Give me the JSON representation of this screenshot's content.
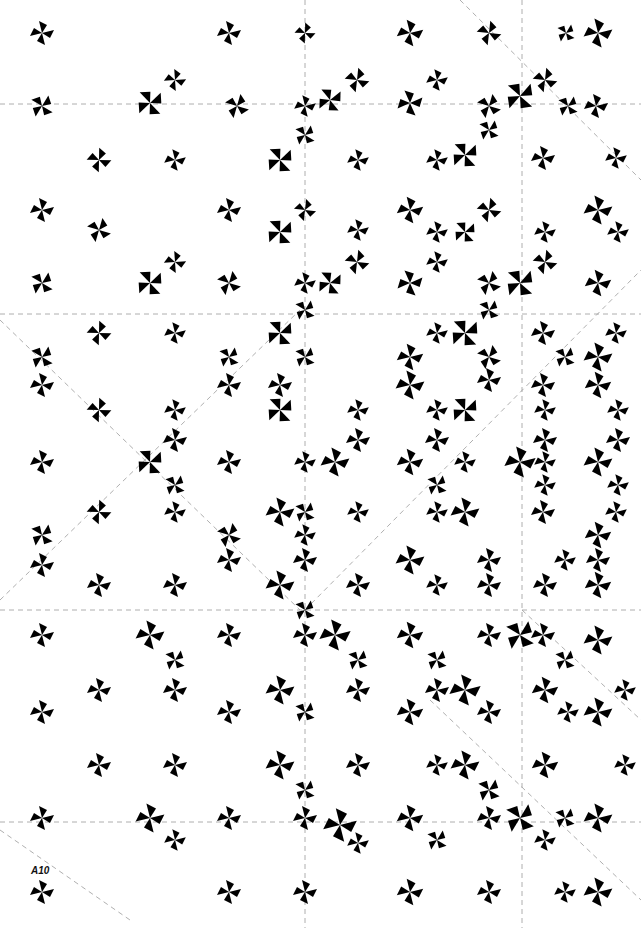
{
  "artwork": {
    "label": "A10",
    "background": "#ffffff",
    "ink": "#000000",
    "guide_color": "#9a9a9a",
    "guides": {
      "horizontal": [
        104,
        314,
        610,
        822
      ],
      "vertical": [
        305,
        522
      ],
      "diagonal": [
        [
          0,
          320,
          300,
          610
        ],
        [
          0,
          600,
          300,
          310
        ],
        [
          305,
          610,
          641,
          270
        ],
        [
          460,
          0,
          641,
          180
        ],
        [
          522,
          610,
          641,
          720
        ],
        [
          430,
          700,
          641,
          900
        ],
        [
          0,
          830,
          130,
          920
        ]
      ]
    },
    "motifs": [
      {
        "x": 42,
        "y": 33,
        "s": 1,
        "r": 0
      },
      {
        "x": 229,
        "y": 33,
        "s": 1,
        "r": 0
      },
      {
        "x": 305,
        "y": 33,
        "s": 0.85,
        "r": 15
      },
      {
        "x": 410,
        "y": 33,
        "s": 1.1,
        "r": 0
      },
      {
        "x": 489,
        "y": 33,
        "s": 1,
        "r": 20
      },
      {
        "x": 598,
        "y": 33,
        "s": 1.2,
        "r": 0
      },
      {
        "x": 566,
        "y": 33,
        "s": 0.8,
        "r": 45
      },
      {
        "x": 42,
        "y": 106,
        "s": 1,
        "r": 45
      },
      {
        "x": 150,
        "y": 103,
        "s": 1.2,
        "r": -30
      },
      {
        "x": 175,
        "y": 80,
        "s": 0.9,
        "r": 10
      },
      {
        "x": 237,
        "y": 106,
        "s": 1,
        "r": 30
      },
      {
        "x": 305,
        "y": 106,
        "s": 0.9,
        "r": 0
      },
      {
        "x": 330,
        "y": 100,
        "s": 1.1,
        "r": -25
      },
      {
        "x": 357,
        "y": 80,
        "s": 1,
        "r": 20
      },
      {
        "x": 410,
        "y": 103,
        "s": 1.1,
        "r": -10
      },
      {
        "x": 437,
        "y": 80,
        "s": 0.9,
        "r": 0
      },
      {
        "x": 489,
        "y": 106,
        "s": 1,
        "r": 30
      },
      {
        "x": 520,
        "y": 96,
        "s": 1.3,
        "r": -35
      },
      {
        "x": 545,
        "y": 80,
        "s": 1,
        "r": 20
      },
      {
        "x": 568,
        "y": 106,
        "s": 0.9,
        "r": 45
      },
      {
        "x": 596,
        "y": 106,
        "s": 1,
        "r": 0
      },
      {
        "x": 99,
        "y": 160,
        "s": 1,
        "r": 15
      },
      {
        "x": 175,
        "y": 160,
        "s": 0.9,
        "r": 0
      },
      {
        "x": 280,
        "y": 160,
        "s": 1.2,
        "r": -30
      },
      {
        "x": 305,
        "y": 135,
        "s": 0.9,
        "r": 45
      },
      {
        "x": 358,
        "y": 160,
        "s": 0.9,
        "r": 0
      },
      {
        "x": 437,
        "y": 160,
        "s": 0.9,
        "r": 0
      },
      {
        "x": 465,
        "y": 155,
        "s": 1.2,
        "r": -30
      },
      {
        "x": 489,
        "y": 130,
        "s": 0.9,
        "r": 45
      },
      {
        "x": 543,
        "y": 158,
        "s": 1,
        "r": 0
      },
      {
        "x": 616,
        "y": 158,
        "s": 0.9,
        "r": 0
      },
      {
        "x": 42,
        "y": 210,
        "s": 1,
        "r": 0
      },
      {
        "x": 99,
        "y": 230,
        "s": 1,
        "r": 30
      },
      {
        "x": 229,
        "y": 210,
        "s": 1,
        "r": 0
      },
      {
        "x": 280,
        "y": 232,
        "s": 1.2,
        "r": -30
      },
      {
        "x": 305,
        "y": 210,
        "s": 0.9,
        "r": 20
      },
      {
        "x": 358,
        "y": 230,
        "s": 0.9,
        "r": 0
      },
      {
        "x": 410,
        "y": 210,
        "s": 1.1,
        "r": 0
      },
      {
        "x": 437,
        "y": 232,
        "s": 0.9,
        "r": 0
      },
      {
        "x": 465,
        "y": 232,
        "s": 1,
        "r": -30
      },
      {
        "x": 489,
        "y": 210,
        "s": 1,
        "r": 20
      },
      {
        "x": 545,
        "y": 232,
        "s": 0.9,
        "r": 0
      },
      {
        "x": 598,
        "y": 210,
        "s": 1.2,
        "r": 0
      },
      {
        "x": 618,
        "y": 232,
        "s": 0.9,
        "r": 0
      },
      {
        "x": 42,
        "y": 283,
        "s": 1,
        "r": 45
      },
      {
        "x": 150,
        "y": 283,
        "s": 1.2,
        "r": -30
      },
      {
        "x": 175,
        "y": 262,
        "s": 0.9,
        "r": 10
      },
      {
        "x": 229,
        "y": 283,
        "s": 1,
        "r": 30
      },
      {
        "x": 305,
        "y": 283,
        "s": 0.9,
        "r": 0
      },
      {
        "x": 330,
        "y": 283,
        "s": 1.1,
        "r": -25
      },
      {
        "x": 357,
        "y": 262,
        "s": 1,
        "r": 20
      },
      {
        "x": 410,
        "y": 283,
        "s": 1.1,
        "r": -10
      },
      {
        "x": 437,
        "y": 262,
        "s": 0.9,
        "r": 0
      },
      {
        "x": 489,
        "y": 283,
        "s": 1,
        "r": 30
      },
      {
        "x": 520,
        "y": 283,
        "s": 1.3,
        "r": -35
      },
      {
        "x": 545,
        "y": 262,
        "s": 1,
        "r": 20
      },
      {
        "x": 598,
        "y": 283,
        "s": 1.1,
        "r": 0
      },
      {
        "x": 99,
        "y": 333,
        "s": 1,
        "r": 15
      },
      {
        "x": 175,
        "y": 333,
        "s": 0.9,
        "r": 0
      },
      {
        "x": 229,
        "y": 357,
        "s": 0.9,
        "r": 45
      },
      {
        "x": 280,
        "y": 333,
        "s": 1.2,
        "r": -30
      },
      {
        "x": 305,
        "y": 310,
        "s": 0.9,
        "r": 45
      },
      {
        "x": 437,
        "y": 333,
        "s": 0.9,
        "r": 0
      },
      {
        "x": 465,
        "y": 333,
        "s": 1.3,
        "r": -30
      },
      {
        "x": 489,
        "y": 310,
        "s": 0.9,
        "r": 45
      },
      {
        "x": 543,
        "y": 333,
        "s": 1,
        "r": 0
      },
      {
        "x": 616,
        "y": 333,
        "s": 0.9,
        "r": 0
      },
      {
        "x": 42,
        "y": 357,
        "s": 1,
        "r": 45
      },
      {
        "x": 42,
        "y": 385,
        "s": 1,
        "r": 0
      },
      {
        "x": 305,
        "y": 357,
        "s": 0.9,
        "r": 45
      },
      {
        "x": 410,
        "y": 357,
        "s": 1.1,
        "r": 0
      },
      {
        "x": 489,
        "y": 357,
        "s": 1,
        "r": 30
      },
      {
        "x": 565,
        "y": 357,
        "s": 0.9,
        "r": 45
      },
      {
        "x": 598,
        "y": 357,
        "s": 1.2,
        "r": 0
      },
      {
        "x": 229,
        "y": 385,
        "s": 1,
        "r": 0
      },
      {
        "x": 280,
        "y": 385,
        "s": 1,
        "r": 0
      },
      {
        "x": 410,
        "y": 385,
        "s": 1.2,
        "r": 0
      },
      {
        "x": 489,
        "y": 380,
        "s": 1,
        "r": 0
      },
      {
        "x": 543,
        "y": 385,
        "s": 1,
        "r": 0
      },
      {
        "x": 598,
        "y": 385,
        "s": 1.1,
        "r": 0
      },
      {
        "x": 99,
        "y": 410,
        "s": 1,
        "r": 15
      },
      {
        "x": 175,
        "y": 410,
        "s": 0.9,
        "r": 0
      },
      {
        "x": 280,
        "y": 410,
        "s": 1.2,
        "r": -30
      },
      {
        "x": 358,
        "y": 410,
        "s": 0.9,
        "r": 0
      },
      {
        "x": 437,
        "y": 410,
        "s": 0.9,
        "r": 0
      },
      {
        "x": 465,
        "y": 410,
        "s": 1.2,
        "r": -30
      },
      {
        "x": 545,
        "y": 410,
        "s": 0.9,
        "r": 0
      },
      {
        "x": 618,
        "y": 410,
        "s": 0.9,
        "r": 0
      },
      {
        "x": 175,
        "y": 440,
        "s": 1,
        "r": 0
      },
      {
        "x": 358,
        "y": 440,
        "s": 1,
        "r": 0
      },
      {
        "x": 437,
        "y": 440,
        "s": 1,
        "r": 0
      },
      {
        "x": 545,
        "y": 440,
        "s": 1,
        "r": 0
      },
      {
        "x": 618,
        "y": 440,
        "s": 1,
        "r": 0
      },
      {
        "x": 42,
        "y": 462,
        "s": 1,
        "r": 0
      },
      {
        "x": 150,
        "y": 462,
        "s": 1.2,
        "r": -30
      },
      {
        "x": 229,
        "y": 462,
        "s": 1,
        "r": 0
      },
      {
        "x": 305,
        "y": 462,
        "s": 0.9,
        "r": 0
      },
      {
        "x": 335,
        "y": 462,
        "s": 1.2,
        "r": 0
      },
      {
        "x": 410,
        "y": 462,
        "s": 1.1,
        "r": 0
      },
      {
        "x": 465,
        "y": 462,
        "s": 0.9,
        "r": 0
      },
      {
        "x": 520,
        "y": 462,
        "s": 1.3,
        "r": 0
      },
      {
        "x": 545,
        "y": 462,
        "s": 0.9,
        "r": 0
      },
      {
        "x": 598,
        "y": 462,
        "s": 1.2,
        "r": 0
      },
      {
        "x": 175,
        "y": 485,
        "s": 0.9,
        "r": 45
      },
      {
        "x": 437,
        "y": 485,
        "s": 0.9,
        "r": 45
      },
      {
        "x": 545,
        "y": 485,
        "s": 0.9,
        "r": 0
      },
      {
        "x": 618,
        "y": 485,
        "s": 0.9,
        "r": 0
      },
      {
        "x": 99,
        "y": 512,
        "s": 1,
        "r": 15
      },
      {
        "x": 175,
        "y": 512,
        "s": 0.9,
        "r": 0
      },
      {
        "x": 280,
        "y": 512,
        "s": 1.2,
        "r": 0
      },
      {
        "x": 305,
        "y": 512,
        "s": 0.9,
        "r": 45
      },
      {
        "x": 358,
        "y": 512,
        "s": 0.9,
        "r": 0
      },
      {
        "x": 437,
        "y": 512,
        "s": 0.9,
        "r": 0
      },
      {
        "x": 465,
        "y": 512,
        "s": 1.2,
        "r": 0
      },
      {
        "x": 543,
        "y": 512,
        "s": 1,
        "r": 0
      },
      {
        "x": 616,
        "y": 512,
        "s": 0.9,
        "r": 0
      },
      {
        "x": 42,
        "y": 535,
        "s": 1,
        "r": 45
      },
      {
        "x": 42,
        "y": 565,
        "s": 1,
        "r": 0
      },
      {
        "x": 229,
        "y": 535,
        "s": 1,
        "r": 30
      },
      {
        "x": 229,
        "y": 560,
        "s": 1,
        "r": 0
      },
      {
        "x": 305,
        "y": 535,
        "s": 0.9,
        "r": 0
      },
      {
        "x": 305,
        "y": 560,
        "s": 1,
        "r": 0
      },
      {
        "x": 410,
        "y": 560,
        "s": 1.2,
        "r": 0
      },
      {
        "x": 489,
        "y": 560,
        "s": 1,
        "r": 0
      },
      {
        "x": 565,
        "y": 560,
        "s": 0.9,
        "r": 0
      },
      {
        "x": 598,
        "y": 535,
        "s": 1.1,
        "r": 0
      },
      {
        "x": 598,
        "y": 560,
        "s": 1,
        "r": 0
      },
      {
        "x": 99,
        "y": 585,
        "s": 1,
        "r": 0
      },
      {
        "x": 175,
        "y": 585,
        "s": 1,
        "r": 0
      },
      {
        "x": 280,
        "y": 585,
        "s": 1.2,
        "r": 0
      },
      {
        "x": 305,
        "y": 610,
        "s": 0.9,
        "r": 45
      },
      {
        "x": 358,
        "y": 585,
        "s": 1,
        "r": 0
      },
      {
        "x": 437,
        "y": 585,
        "s": 0.9,
        "r": 0
      },
      {
        "x": 489,
        "y": 585,
        "s": 1,
        "r": 0
      },
      {
        "x": 545,
        "y": 585,
        "s": 1,
        "r": 0
      },
      {
        "x": 598,
        "y": 585,
        "s": 1.1,
        "r": 0
      },
      {
        "x": 42,
        "y": 635,
        "s": 1,
        "r": 0
      },
      {
        "x": 150,
        "y": 635,
        "s": 1.2,
        "r": 0
      },
      {
        "x": 229,
        "y": 635,
        "s": 1,
        "r": 0
      },
      {
        "x": 305,
        "y": 635,
        "s": 1,
        "r": 0
      },
      {
        "x": 335,
        "y": 635,
        "s": 1.3,
        "r": 0
      },
      {
        "x": 410,
        "y": 635,
        "s": 1.1,
        "r": 0
      },
      {
        "x": 489,
        "y": 635,
        "s": 1,
        "r": 0
      },
      {
        "x": 520,
        "y": 635,
        "s": 1.3,
        "r": 45
      },
      {
        "x": 543,
        "y": 635,
        "s": 1,
        "r": 0
      },
      {
        "x": 598,
        "y": 640,
        "s": 1.2,
        "r": 0
      },
      {
        "x": 175,
        "y": 660,
        "s": 0.9,
        "r": 45
      },
      {
        "x": 358,
        "y": 660,
        "s": 0.9,
        "r": 45
      },
      {
        "x": 437,
        "y": 660,
        "s": 0.9,
        "r": 45
      },
      {
        "x": 565,
        "y": 660,
        "s": 0.9,
        "r": 45
      },
      {
        "x": 42,
        "y": 712,
        "s": 1,
        "r": 0
      },
      {
        "x": 99,
        "y": 690,
        "s": 1,
        "r": 0
      },
      {
        "x": 175,
        "y": 690,
        "s": 1,
        "r": 0
      },
      {
        "x": 229,
        "y": 712,
        "s": 1,
        "r": 0
      },
      {
        "x": 280,
        "y": 690,
        "s": 1.2,
        "r": 0
      },
      {
        "x": 305,
        "y": 712,
        "s": 0.9,
        "r": 45
      },
      {
        "x": 358,
        "y": 690,
        "s": 1,
        "r": 0
      },
      {
        "x": 410,
        "y": 712,
        "s": 1.1,
        "r": 0
      },
      {
        "x": 437,
        "y": 690,
        "s": 1,
        "r": 0
      },
      {
        "x": 465,
        "y": 690,
        "s": 1.3,
        "r": 0
      },
      {
        "x": 489,
        "y": 712,
        "s": 1,
        "r": 0
      },
      {
        "x": 545,
        "y": 690,
        "s": 1.1,
        "r": 0
      },
      {
        "x": 568,
        "y": 712,
        "s": 0.9,
        "r": 0
      },
      {
        "x": 598,
        "y": 712,
        "s": 1.2,
        "r": 0
      },
      {
        "x": 625,
        "y": 690,
        "s": 0.9,
        "r": 0
      },
      {
        "x": 99,
        "y": 765,
        "s": 1,
        "r": 0
      },
      {
        "x": 175,
        "y": 765,
        "s": 1,
        "r": 0
      },
      {
        "x": 280,
        "y": 765,
        "s": 1.2,
        "r": 0
      },
      {
        "x": 305,
        "y": 790,
        "s": 0.9,
        "r": 45
      },
      {
        "x": 358,
        "y": 765,
        "s": 1,
        "r": 0
      },
      {
        "x": 437,
        "y": 765,
        "s": 0.9,
        "r": 0
      },
      {
        "x": 465,
        "y": 765,
        "s": 1.2,
        "r": 0
      },
      {
        "x": 489,
        "y": 790,
        "s": 1,
        "r": 45
      },
      {
        "x": 545,
        "y": 765,
        "s": 1.1,
        "r": 0
      },
      {
        "x": 625,
        "y": 765,
        "s": 0.9,
        "r": 0
      },
      {
        "x": 42,
        "y": 818,
        "s": 1,
        "r": 0
      },
      {
        "x": 150,
        "y": 818,
        "s": 1.2,
        "r": 0
      },
      {
        "x": 175,
        "y": 840,
        "s": 0.9,
        "r": 0
      },
      {
        "x": 229,
        "y": 818,
        "s": 1,
        "r": 0
      },
      {
        "x": 305,
        "y": 818,
        "s": 1,
        "r": 0
      },
      {
        "x": 340,
        "y": 825,
        "s": 1.4,
        "r": 0
      },
      {
        "x": 358,
        "y": 843,
        "s": 0.9,
        "r": 0
      },
      {
        "x": 410,
        "y": 818,
        "s": 1.1,
        "r": 0
      },
      {
        "x": 437,
        "y": 840,
        "s": 0.9,
        "r": 45
      },
      {
        "x": 489,
        "y": 818,
        "s": 1,
        "r": 0
      },
      {
        "x": 520,
        "y": 818,
        "s": 1.3,
        "r": 45
      },
      {
        "x": 545,
        "y": 840,
        "s": 0.9,
        "r": 0
      },
      {
        "x": 565,
        "y": 818,
        "s": 0.9,
        "r": 45
      },
      {
        "x": 598,
        "y": 818,
        "s": 1.2,
        "r": 0
      },
      {
        "x": 42,
        "y": 892,
        "s": 1,
        "r": 0
      },
      {
        "x": 229,
        "y": 892,
        "s": 1,
        "r": 0
      },
      {
        "x": 305,
        "y": 892,
        "s": 1,
        "r": 0
      },
      {
        "x": 410,
        "y": 892,
        "s": 1.1,
        "r": 0
      },
      {
        "x": 489,
        "y": 892,
        "s": 1,
        "r": 0
      },
      {
        "x": 565,
        "y": 892,
        "s": 0.9,
        "r": 0
      },
      {
        "x": 598,
        "y": 892,
        "s": 1.2,
        "r": 0
      }
    ]
  }
}
